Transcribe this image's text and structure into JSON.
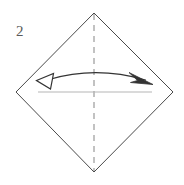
{
  "figure": {
    "type": "origami-fold-diagram",
    "step_number": "2",
    "background_color": "#ffffff",
    "canvas": {
      "width": 184,
      "height": 185
    },
    "shapes": {
      "paper_outline": {
        "name": "square-rotated-45",
        "stroke_color": "#4a4a4a",
        "stroke_width": 1,
        "fill": "none",
        "vertices": [
          {
            "label": "top",
            "x": 94,
            "y": 13
          },
          {
            "label": "right",
            "x": 173,
            "y": 92
          },
          {
            "label": "bottom",
            "x": 94,
            "y": 172
          },
          {
            "label": "left",
            "x": 16,
            "y": 92
          }
        ]
      },
      "fold_line_vertical": {
        "name": "vertical-dashed-fold-line",
        "stroke_color": "#9a9a9a",
        "stroke_width": 1.2,
        "dash_pattern": "6 5",
        "x1": 94,
        "y1": 14,
        "x2": 94,
        "y2": 171
      },
      "guide_line_horizontal": {
        "name": "horizontal-guide-line",
        "stroke_color": "#b5b5b5",
        "stroke_width": 1,
        "x1": 38,
        "y1": 92,
        "x2": 152,
        "y2": 92
      },
      "fold_arrow": {
        "name": "double-headed-curved-fold-arrow",
        "stroke_color": "#333333",
        "stroke_width": 1.3,
        "fill": "none",
        "arc_start": {
          "x": 48,
          "y": 80
        },
        "arc_control": {
          "x": 96,
          "y": 66
        },
        "arc_end": {
          "x": 146,
          "y": 80
        },
        "left_head": {
          "style": "hollow-outline-triangle",
          "stroke_color": "#333333",
          "fill": "#ffffff",
          "points": "37,80 53,73 50,89"
        },
        "right_head": {
          "style": "solid-narrow-arrowhead",
          "fill": "#333333",
          "points": "152,83 130,74 136,80 131,83"
        }
      }
    }
  }
}
